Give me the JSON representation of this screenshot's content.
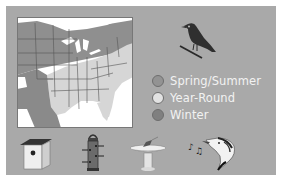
{
  "figure": {
    "type": "bird range map legend",
    "colors": {
      "background": "#a9a9a9",
      "map_land_year_round": "#d6d6d6",
      "map_land_spring_summer": "#8f8f8f",
      "map_land_winter": "#7a7a7a",
      "legend_text": "#f2f2f2"
    }
  },
  "legend": {
    "items": [
      {
        "label": "Spring/Summer",
        "color": "#939393"
      },
      {
        "label": "Year-Round",
        "color": "#e2e2e2"
      },
      {
        "label": "Winter",
        "color": "#808080"
      }
    ]
  },
  "icons": [
    {
      "name": "birdhouse-icon"
    },
    {
      "name": "tube-feeder-icon"
    },
    {
      "name": "birdbath-icon"
    },
    {
      "name": "singing-bird-icon"
    }
  ],
  "bird": {
    "name": "perched-bird-icon"
  }
}
